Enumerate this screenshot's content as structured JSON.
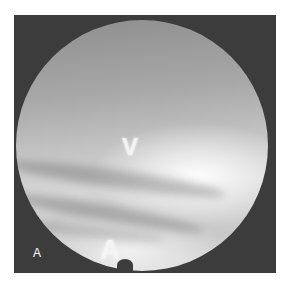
{
  "figure": {
    "panel_label": "A",
    "markers": {
      "upper": "V",
      "lower": "A"
    },
    "colors": {
      "frame": "#3c3c3c",
      "background": "#ffffff",
      "marker": "#f4f4f4"
    }
  }
}
